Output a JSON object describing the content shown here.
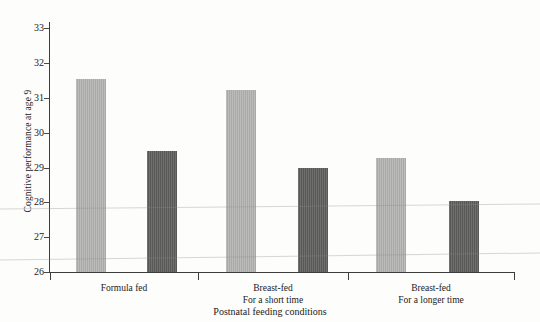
{
  "chart_data": {
    "type": "bar",
    "title": "",
    "subtitle": "",
    "xlabel": "Postnatal feeding conditions",
    "ylabel": "Cognitive performance at age 9",
    "ylim": [
      26,
      33
    ],
    "yticks": [
      26,
      27,
      28,
      29,
      30,
      31,
      32,
      33
    ],
    "ytick_labels": [
      "26",
      "27",
      "28",
      "29",
      "30",
      "31",
      "32",
      "33"
    ],
    "grid": false,
    "legend": "none",
    "categories": [
      "Formula fed",
      "Breast-fed\nFor a short time",
      "Breast-fed\nFor a longer time"
    ],
    "series": [
      {
        "name": "light-bar",
        "color": "#a9a9a7",
        "values": [
          31.4,
          31.1,
          29.2
        ]
      },
      {
        "name": "dark-bar",
        "color": "#585857",
        "values": [
          29.4,
          28.9,
          28.0
        ]
      }
    ]
  },
  "axes": {
    "y_label": "Cognitive performance at age 9",
    "x_label": "Postnatal feeding conditions",
    "y_ticks": [
      {
        "value": 33,
        "label": "33"
      },
      {
        "value": 32,
        "label": "32"
      },
      {
        "value": 31,
        "label": "31"
      },
      {
        "value": 30,
        "label": "30"
      },
      {
        "value": 29,
        "label": "29"
      },
      {
        "value": 28,
        "label": "28"
      },
      {
        "value": 27,
        "label": "27"
      },
      {
        "value": 26,
        "label": "26"
      }
    ]
  },
  "groups": [
    {
      "label_line1": "Formula fed",
      "label_line2": "",
      "bars": [
        {
          "style": "light",
          "value": 31.4
        },
        {
          "style": "dark",
          "value": 29.4
        }
      ]
    },
    {
      "label_line1": "Breast-fed",
      "label_line2": "For a short time",
      "bars": [
        {
          "style": "light",
          "value": 31.1
        },
        {
          "style": "dark",
          "value": 28.9
        }
      ]
    },
    {
      "label_line1": "Breast-fed",
      "label_line2": "For a longer time",
      "bars": [
        {
          "style": "light",
          "value": 29.2
        },
        {
          "style": "dark",
          "value": 28.0
        }
      ]
    }
  ],
  "colors": {
    "light_bar": "#a9a9a7",
    "dark_bar": "#585857",
    "axis": "#3d3d3d",
    "text": "#1b1b1b"
  }
}
